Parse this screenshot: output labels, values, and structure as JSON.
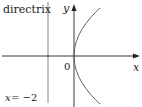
{
  "diagram": {
    "labels": {
      "directrix": "directrix",
      "y_axis": "y",
      "x_axis": "x",
      "origin": "0",
      "directrix_eq_x": "x",
      "directrix_eq_rest": " = −2"
    },
    "colors": {
      "axis": "#222222",
      "curve": "#555555",
      "directrix_line": "#777777"
    }
  }
}
